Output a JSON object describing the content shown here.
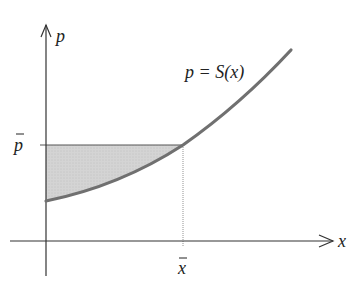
{
  "diagram": {
    "curve_label": "p = S(x)",
    "axis_labels": {
      "x": "x",
      "y": "p"
    },
    "tick_labels": {
      "p_bar": "p",
      "x_bar": "x"
    },
    "colors": {
      "curve": "#707070",
      "axes": "#333333",
      "shading": "#d0d0d0",
      "guide": "#555555"
    },
    "shaded_region": "area between price line p̄ and supply curve S(x) from 0 to x̄"
  }
}
